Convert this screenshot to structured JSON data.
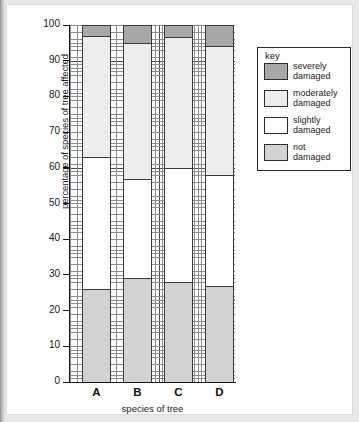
{
  "chart_data": {
    "type": "bar",
    "subtype": "stacked-bar-100",
    "title": "",
    "xlabel": "species of tree",
    "ylabel": "percentage of species of tree affected",
    "categories": [
      "A",
      "B",
      "C",
      "D"
    ],
    "ylim": [
      0,
      100
    ],
    "ytick_step": 10,
    "yticks": [
      0,
      10,
      20,
      30,
      40,
      50,
      60,
      70,
      80,
      90,
      100
    ],
    "grid": true,
    "grid_style": "graph-paper",
    "legend_position": "right",
    "legend_title": "key",
    "series": [
      {
        "name": "not damaged",
        "color": "#d2d2d2",
        "values": [
          26,
          29,
          28,
          27
        ]
      },
      {
        "name": "slightly damaged",
        "color": "#fefefe",
        "values": [
          37,
          28,
          32,
          31
        ]
      },
      {
        "name": "moderately damaged",
        "color": "#ededed",
        "values": [
          34,
          38,
          36.5,
          36
        ]
      },
      {
        "name": "severely damaged",
        "color": "#a8a8a8",
        "values": [
          3,
          5,
          3.5,
          6
        ]
      }
    ],
    "cumulative_boundaries": {
      "A": [
        0,
        26,
        63,
        97,
        100
      ],
      "B": [
        0,
        29,
        57,
        95,
        100
      ],
      "C": [
        0,
        28,
        60,
        96.5,
        100
      ],
      "D": [
        0,
        27,
        58,
        94,
        100
      ]
    }
  },
  "axis": {
    "ylabel": "percentage of species of tree affected",
    "xlabel": "species of tree",
    "ytick_labels": [
      "100",
      "90",
      "80",
      "70",
      "60",
      "50",
      "40",
      "30",
      "20",
      "10",
      "0"
    ],
    "xtick_labels": [
      "A",
      "B",
      "C",
      "D"
    ]
  },
  "legend": {
    "title": "key",
    "items": [
      {
        "label": "severely\ndamaged",
        "color": "#a8a8a8"
      },
      {
        "label": "moderately\ndamaged",
        "color": "#ededed"
      },
      {
        "label": "slightly\ndamaged",
        "color": "#fefefe"
      },
      {
        "label": "not\ndamaged",
        "color": "#d2d2d2"
      }
    ]
  },
  "colors": {
    "severely_damaged": "#a8a8a8",
    "moderately_damaged": "#ededed",
    "slightly_damaged": "#fefefe",
    "not_damaged": "#d2d2d2",
    "axis": "#151515",
    "grid_major": "#4a4a4a",
    "grid_minor": "#8d8d8d",
    "page_background": "#e9e9e9",
    "sheet_background": "#ffffff"
  }
}
